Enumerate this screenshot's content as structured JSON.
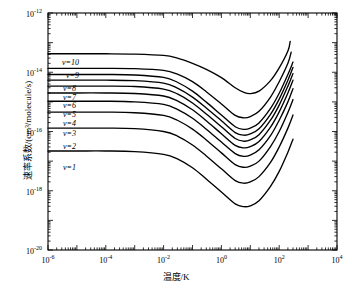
{
  "chart_data": {
    "type": "line",
    "title": "",
    "xlabel": "温度/K",
    "ylabel": "速率系数/(cm³/molecule/s)",
    "xscale": "log",
    "yscale": "log",
    "xlim": [
      1e-06,
      10000.0
    ],
    "ylim": [
      1e-20,
      1e-12
    ],
    "grid": false,
    "legend_position": "inline-left",
    "xticks": [
      {
        "value": 1e-06,
        "mantissa": "10",
        "exponent": "-6"
      },
      {
        "value": 0.0001,
        "mantissa": "10",
        "exponent": "-4"
      },
      {
        "value": 0.01,
        "mantissa": "10",
        "exponent": "-2"
      },
      {
        "value": 1.0,
        "mantissa": "10",
        "exponent": "0"
      },
      {
        "value": 100.0,
        "mantissa": "10",
        "exponent": "2"
      },
      {
        "value": 10000.0,
        "mantissa": "10",
        "exponent": "4"
      }
    ],
    "yticks": [
      {
        "value": 1e-12,
        "mantissa": "10",
        "exponent": "-12"
      },
      {
        "value": 1e-14,
        "mantissa": "10",
        "exponent": "-14"
      },
      {
        "value": 1e-16,
        "mantissa": "10",
        "exponent": "-16"
      },
      {
        "value": 1e-18,
        "mantissa": "10",
        "exponent": "-18"
      },
      {
        "value": 1e-20,
        "mantissa": "10",
        "exponent": "-20"
      }
    ],
    "series": [
      {
        "name": "v=1",
        "label": "v=1",
        "x": [
          1e-06,
          1e-05,
          0.0001,
          0.001,
          0.01,
          0.03,
          0.1,
          0.3,
          1.0,
          3.0,
          6.0,
          10.0,
          20.0,
          50.0,
          100.0,
          200.0,
          300.0
        ],
        "y": [
          2.2e-17,
          2.2e-17,
          2.2e-17,
          2.1e-17,
          1.7e-17,
          1.2e-17,
          6e-18,
          2.5e-18,
          9e-19,
          3.6e-19,
          2.9e-19,
          3.1e-19,
          4.6e-19,
          1.4e-18,
          4.5e-18,
          2e-17,
          5.5e-17
        ]
      },
      {
        "name": "v=2",
        "label": "v=2",
        "x": [
          1e-06,
          1e-05,
          0.0001,
          0.001,
          0.01,
          0.03,
          0.1,
          0.3,
          1.0,
          3.0,
          6.0,
          10.0,
          20.0,
          50.0,
          100.0,
          200.0,
          300.0
        ],
        "y": [
          1.3e-16,
          1.3e-16,
          1.3e-16,
          1.25e-16,
          1e-16,
          7e-17,
          3.5e-17,
          1.5e-17,
          5.5e-18,
          2.2e-18,
          1.8e-18,
          2e-18,
          3e-18,
          9e-18,
          3e-17,
          1.3e-16,
          3.6e-16
        ]
      },
      {
        "name": "v=3",
        "label": "v=3",
        "x": [
          1e-06,
          1e-05,
          0.0001,
          0.001,
          0.01,
          0.03,
          0.1,
          0.3,
          1.0,
          3.0,
          6.0,
          10.0,
          20.0,
          50.0,
          100.0,
          200.0,
          300.0
        ],
        "y": [
          4.5e-16,
          4.5e-16,
          4.5e-16,
          4.3e-16,
          3.5e-16,
          2.4e-16,
          1.2e-16,
          5.2e-17,
          1.9e-17,
          7.6e-18,
          6.2e-18,
          6.8e-18,
          1e-17,
          3.1e-17,
          1e-16,
          4.4e-16,
          1.2e-15
        ]
      },
      {
        "name": "v=4",
        "label": "v=4",
        "x": [
          1e-06,
          1e-05,
          0.0001,
          0.001,
          0.01,
          0.03,
          0.1,
          0.3,
          1.0,
          3.0,
          6.0,
          10.0,
          20.0,
          50.0,
          100.0,
          200.0,
          300.0
        ],
        "y": [
          1.05e-15,
          1.05e-15,
          1.05e-15,
          1e-15,
          8.2e-16,
          5.6e-16,
          2.8e-16,
          1.2e-16,
          4.4e-17,
          1.8e-17,
          1.45e-17,
          1.6e-17,
          2.4e-17,
          7.2e-17,
          2.4e-16,
          1e-15,
          2.8e-15
        ]
      },
      {
        "name": "v=5",
        "label": "v=5",
        "x": [
          1e-06,
          1e-05,
          0.0001,
          0.001,
          0.01,
          0.03,
          0.1,
          0.3,
          1.0,
          3.0,
          6.0,
          10.0,
          20.0,
          50.0,
          100.0,
          200.0,
          300.0
        ],
        "y": [
          2e-15,
          2e-15,
          2e-15,
          1.92e-15,
          1.58e-15,
          1.08e-15,
          5.4e-16,
          2.3e-16,
          8.4e-17,
          3.4e-17,
          2.8e-17,
          3.1e-17,
          4.6e-17,
          1.4e-16,
          4.6e-16,
          2e-15,
          5.4e-15
        ]
      },
      {
        "name": "v=6",
        "label": "v=6",
        "x": [
          1e-06,
          1e-05,
          0.0001,
          0.001,
          0.01,
          0.03,
          0.1,
          0.3,
          1.0,
          3.0,
          6.0,
          10.0,
          20.0,
          50.0,
          100.0,
          200.0,
          300.0
        ],
        "y": [
          3.4e-15,
          3.4e-15,
          3.4e-15,
          3.3e-15,
          2.7e-15,
          1.85e-15,
          9.2e-16,
          3.9e-16,
          1.45e-16,
          5.8e-17,
          4.7e-17,
          5.2e-17,
          7.8e-17,
          2.4e-16,
          7.8e-16,
          3.4e-15,
          9e-15
        ]
      },
      {
        "name": "v=7",
        "label": "v=7",
        "x": [
          1e-06,
          1e-05,
          0.0001,
          0.001,
          0.01,
          0.03,
          0.1,
          0.3,
          1.0,
          3.0,
          6.0,
          10.0,
          20.0,
          50.0,
          100.0,
          200.0,
          300.0
        ],
        "y": [
          5.4e-15,
          5.4e-15,
          5.4e-15,
          5.2e-15,
          4.3e-15,
          2.9e-15,
          1.45e-15,
          6.2e-16,
          2.3e-16,
          9.2e-17,
          7.5e-17,
          8.3e-17,
          1.24e-16,
          3.8e-16,
          1.24e-15,
          5.4e-15,
          1.45e-14
        ]
      },
      {
        "name": "v=8",
        "label": "v=8",
        "x": [
          1e-06,
          1e-05,
          0.0001,
          0.001,
          0.01,
          0.03,
          0.1,
          0.3,
          1.0,
          3.0,
          6.0,
          10.0,
          20.0,
          50.0,
          100.0,
          200.0,
          300.0
        ],
        "y": [
          8.4e-15,
          8.4e-15,
          8.4e-15,
          8.1e-15,
          6.7e-15,
          4.6e-15,
          2.3e-15,
          9.8e-16,
          3.6e-16,
          1.45e-16,
          1.18e-16,
          1.3e-16,
          1.95e-16,
          6e-16,
          1.95e-15,
          8.4e-15,
          2.2e-14
        ]
      },
      {
        "name": "v=9",
        "label": "v=9",
        "x": [
          1e-06,
          1e-05,
          0.0001,
          0.001,
          0.01,
          0.03,
          0.1,
          0.3,
          1.0,
          3.0,
          6.0,
          10.0,
          20.0,
          50.0,
          100.0,
          200.0,
          260.0
        ],
        "y": [
          1.35e-14,
          1.35e-14,
          1.35e-14,
          1.32e-14,
          1.15e-14,
          8.6e-15,
          4.8e-15,
          2.2e-15,
          8.5e-16,
          3.5e-16,
          2.9e-16,
          3.2e-16,
          4.8e-16,
          1.45e-15,
          4.8e-15,
          2e-14,
          4.8e-14
        ]
      },
      {
        "name": "v=10",
        "label": "v=10",
        "x": [
          1e-06,
          1e-05,
          0.0001,
          0.001,
          0.01,
          0.03,
          0.1,
          0.3,
          1.0,
          3.0,
          6.0,
          10.0,
          20.0,
          50.0,
          100.0,
          200.0,
          240.0
        ],
        "y": [
          4.2e-14,
          4.2e-14,
          4.2e-14,
          4.1e-14,
          3.7e-14,
          3e-14,
          2e-14,
          1.25e-14,
          6.6e-15,
          3e-15,
          2.1e-15,
          1.9e-15,
          2.3e-15,
          5.2e-15,
          1.4e-14,
          5.2e-14,
          1.1e-13
        ]
      }
    ],
    "curve_labels": [
      {
        "text": "v=10",
        "x_px": 62,
        "y_px": 58
      },
      {
        "text": "v=9",
        "x_px": 66,
        "y_px": 71
      },
      {
        "text": "v=8",
        "x_px": 63,
        "y_px": 84
      },
      {
        "text": "v=7",
        "x_px": 63,
        "y_px": 93
      },
      {
        "text": "v=6",
        "x_px": 63,
        "y_px": 101
      },
      {
        "text": "v=5",
        "x_px": 63,
        "y_px": 110
      },
      {
        "text": "v=4",
        "x_px": 63,
        "y_px": 119
      },
      {
        "text": "v=3",
        "x_px": 63,
        "y_px": 129
      },
      {
        "text": "v=2",
        "x_px": 63,
        "y_px": 142
      },
      {
        "text": "v=1",
        "x_px": 63,
        "y_px": 163
      }
    ],
    "line_color": "#000000",
    "axis_color": "#000000",
    "background_color": "#ffffff"
  }
}
